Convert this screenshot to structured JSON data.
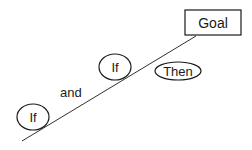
{
  "diagram": {
    "goal": {
      "label": "Goal"
    },
    "nodes": [
      {
        "id": "if-lower",
        "label": "If"
      },
      {
        "id": "if-upper",
        "label": "If"
      },
      {
        "id": "then",
        "label": "Then"
      }
    ],
    "connector_text": "and",
    "colors": {
      "stroke": "#1a1a1a",
      "background": "#ffffff"
    }
  }
}
